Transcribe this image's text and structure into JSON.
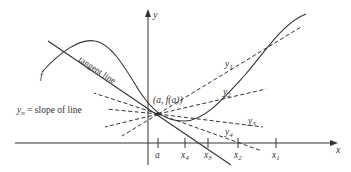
{
  "diagram": {
    "axes": {
      "x_label": "x",
      "y_label": "y"
    },
    "curve_label": "f",
    "tangent_label": "tangent line",
    "point_label": "(a, f(a))",
    "legend_text": "y",
    "legend_sub": "n",
    "legend_rest": " = slope of line",
    "secants": [
      {
        "label": "y",
        "sub": "1"
      },
      {
        "label": "y",
        "sub": "2"
      },
      {
        "label": "y",
        "sub": "3"
      },
      {
        "label": "y",
        "sub": "4"
      }
    ],
    "x_ticks": [
      {
        "label": "a",
        "sub": ""
      },
      {
        "label": "x",
        "sub": "4"
      },
      {
        "label": "x",
        "sub": "3"
      },
      {
        "label": "x",
        "sub": "2"
      },
      {
        "label": "x",
        "sub": "1"
      }
    ],
    "colors": {
      "stroke": "#333333",
      "background": "#ffffff"
    }
  }
}
